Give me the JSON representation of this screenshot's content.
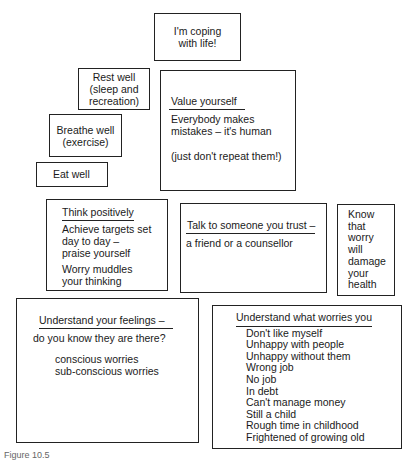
{
  "diagram": {
    "goal": {
      "lines": [
        "I'm coping",
        "with life!"
      ]
    },
    "rest_well": {
      "lines": [
        "Rest well",
        "(sleep and",
        "recreation)"
      ]
    },
    "breathe_well": {
      "lines": [
        "Breathe well",
        "(exercise)"
      ]
    },
    "eat_well": {
      "lines": [
        "Eat well"
      ]
    },
    "value_yourself": {
      "heading": "Value yourself",
      "lines": [
        "Everybody makes",
        "mistakes – it's human"
      ],
      "note": "(just don't repeat them!)"
    },
    "think_positively": {
      "heading": "Think positively",
      "lines": [
        "Achieve targets set",
        "day to day –",
        "praise yourself"
      ],
      "lines2": [
        "Worry muddles",
        "your thinking"
      ]
    },
    "talk": {
      "heading": "Talk to someone you trust –",
      "lines": [
        "a friend or a counsellor"
      ]
    },
    "know_worry": {
      "lines": [
        "Know",
        "that",
        "worry",
        "will",
        "damage",
        "your",
        "health"
      ]
    },
    "understand_feelings": {
      "heading": "Understand your feelings –",
      "subheading": "do you know they are there?",
      "items": [
        "conscious worries",
        "sub-conscious worries"
      ]
    },
    "understand_worries": {
      "heading": "Understand what worries you",
      "items": [
        "Don't like myself",
        "Unhappy with people",
        "Unhappy without them",
        "Wrong job",
        "No job",
        "In debt",
        "Can't manage money",
        "Still a child",
        "Rough time in childhood",
        "Frightened of growing old"
      ]
    }
  },
  "caption": "Figure 10.5"
}
